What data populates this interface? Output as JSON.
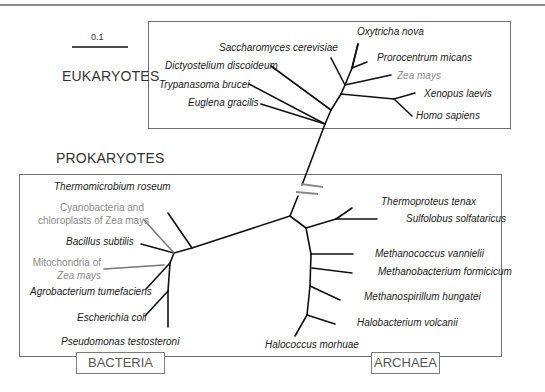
{
  "figure": {
    "scale_bar": {
      "label": "0.1"
    },
    "sections": {
      "eukaryotes": "EUKARYOTES",
      "prokaryotes": "PROKARYOTES"
    },
    "domains": {
      "bacteria": "BACTERIA",
      "archaea": "ARCHAEA"
    },
    "eukaryote_taxa": [
      {
        "name": "Oxytricha nova",
        "color": "#1a1a1a"
      },
      {
        "name": "Saccharomyces cerevisiae",
        "color": "#1a1a1a"
      },
      {
        "name": "Prorocentrum micans",
        "color": "#1a1a1a"
      },
      {
        "name": "Dictyostelium discoideum",
        "color": "#1a1a1a"
      },
      {
        "name": "Zea mays",
        "color": "#8a8a8a"
      },
      {
        "name": "Trypanasoma brucei",
        "color": "#1a1a1a"
      },
      {
        "name": "Xenopus laevis",
        "color": "#1a1a1a"
      },
      {
        "name": "Euglena gracilis",
        "color": "#1a1a1a"
      },
      {
        "name": "Homo sapiens",
        "color": "#1a1a1a"
      }
    ],
    "bacteria_taxa": [
      {
        "name": "Thermomicrobium roseum",
        "color": "#1a1a1a"
      },
      {
        "name": "Cyanobacteria and",
        "name2": "chloroplasts of Zea mays",
        "color": "#8a8a8a"
      },
      {
        "name": "Bacillus subtilis",
        "color": "#1a1a1a"
      },
      {
        "name": "Mitochondria of",
        "name2": "Zea mays",
        "color": "#8a8a8a"
      },
      {
        "name": "Agrobacterium tumefaciens",
        "color": "#1a1a1a"
      },
      {
        "name": "Escherichia coli",
        "color": "#1a1a1a"
      },
      {
        "name": "Pseudomonas testosteroni",
        "color": "#1a1a1a"
      }
    ],
    "archaea_taxa": [
      {
        "name": "Thermoproteus tenax",
        "color": "#1a1a1a"
      },
      {
        "name": "Sulfolobus solfataricus",
        "color": "#1a1a1a"
      },
      {
        "name": "Methanococcus vannielii",
        "color": "#1a1a1a"
      },
      {
        "name": "Methanobacterium formicicum",
        "color": "#1a1a1a"
      },
      {
        "name": "Methanospirillum hungatei",
        "color": "#1a1a1a"
      },
      {
        "name": "Halobacterium volcanii",
        "color": "#1a1a1a"
      },
      {
        "name": "Halococcus morhuae",
        "color": "#1a1a1a"
      }
    ],
    "colors": {
      "branch": "#111111",
      "organelle_branch": "#777777",
      "box_border": "#6e6e6e",
      "grey_label": "#8a8a8a"
    }
  }
}
